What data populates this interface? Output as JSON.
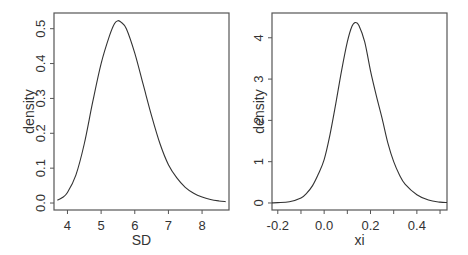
{
  "chart_data": [
    {
      "type": "line",
      "title": "",
      "xlabel": "SD",
      "ylabel": "density",
      "xlim": [
        3.6,
        8.8
      ],
      "ylim": [
        -0.02,
        0.545
      ],
      "grid": false,
      "legend": null,
      "xticks": [
        4,
        5,
        6,
        7,
        8
      ],
      "xtick_labels": [
        "4",
        "5",
        "6",
        "7",
        "8"
      ],
      "yticks": [
        0.0,
        0.1,
        0.2,
        0.3,
        0.4,
        0.5
      ],
      "ytick_labels": [
        "0.0",
        "0.1",
        "0.2",
        "0.3",
        "0.4",
        "0.5"
      ],
      "series": [
        {
          "name": "SD density",
          "x": [
            3.7,
            3.85,
            4.0,
            4.25,
            4.5,
            4.75,
            5.0,
            5.25,
            5.4,
            5.5,
            5.6,
            5.75,
            6.0,
            6.25,
            6.5,
            6.75,
            7.0,
            7.25,
            7.5,
            7.75,
            8.0,
            8.25,
            8.5,
            8.7
          ],
          "values": [
            0.008,
            0.016,
            0.03,
            0.08,
            0.17,
            0.29,
            0.4,
            0.48,
            0.515,
            0.523,
            0.518,
            0.5,
            0.43,
            0.34,
            0.25,
            0.17,
            0.11,
            0.072,
            0.045,
            0.028,
            0.017,
            0.01,
            0.006,
            0.004
          ]
        }
      ]
    },
    {
      "type": "line",
      "title": "",
      "xlabel": "xi",
      "ylabel": "density",
      "xlim": [
        -0.225,
        0.53
      ],
      "ylim": [
        -0.17,
        4.6
      ],
      "grid": false,
      "legend": null,
      "xticks": [
        -0.2,
        0.0,
        0.2,
        0.4
      ],
      "xtick_labels": [
        "-0.2",
        "0.0",
        "0.2",
        "0.4"
      ],
      "minor_xticks": [
        -0.1,
        0.1,
        0.3,
        0.5
      ],
      "yticks": [
        0,
        1,
        2,
        3,
        4
      ],
      "ytick_labels": [
        "0",
        "1",
        "2",
        "3",
        "4"
      ],
      "series": [
        {
          "name": "xi density",
          "x": [
            -0.225,
            -0.2,
            -0.15,
            -0.1,
            -0.075,
            -0.05,
            -0.025,
            0.0,
            0.025,
            0.05,
            0.075,
            0.1,
            0.12,
            0.135,
            0.15,
            0.175,
            0.2,
            0.225,
            0.25,
            0.275,
            0.3,
            0.325,
            0.35,
            0.4,
            0.45,
            0.5,
            0.53
          ],
          "values": [
            0.003,
            0.008,
            0.03,
            0.12,
            0.24,
            0.42,
            0.7,
            1.05,
            1.65,
            2.4,
            3.2,
            3.9,
            4.28,
            4.37,
            4.3,
            3.9,
            3.2,
            2.6,
            2.05,
            1.45,
            1.0,
            0.68,
            0.45,
            0.2,
            0.07,
            0.02,
            0.01
          ]
        }
      ]
    }
  ]
}
